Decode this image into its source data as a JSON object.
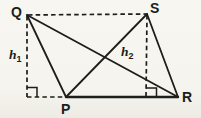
{
  "diagram": {
    "vertices": {
      "q": "Q",
      "s": "S",
      "p": "P",
      "r": "R"
    },
    "heights": {
      "h1": {
        "base": "h",
        "sub": "1"
      },
      "h2": {
        "base": "h",
        "sub": "2"
      }
    },
    "colors": {
      "ink": "#1d1d1b",
      "paper": "#f5f4ee"
    }
  }
}
